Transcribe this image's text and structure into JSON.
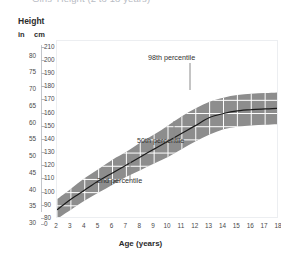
{
  "title_strip": {
    "text": "Girls' Height (2 to 18 years)"
  },
  "axis_heading": {
    "label": "Height"
  },
  "units": {
    "imperial": "in",
    "metric": "cm"
  },
  "y_axis_in": {
    "label": "in",
    "ticks": [
      80,
      75,
      70,
      65,
      60,
      55,
      50,
      45,
      40,
      35,
      30
    ]
  },
  "y_axis_cm": {
    "label": "cm",
    "ticks": [
      210,
      200,
      190,
      180,
      170,
      160,
      150,
      140,
      130,
      120,
      110,
      100,
      90,
      80,
      0
    ]
  },
  "x_axis": {
    "title": "Age (years)",
    "ticks": [
      2,
      3,
      4,
      5,
      6,
      7,
      8,
      9,
      10,
      11,
      12,
      13,
      14,
      15,
      16,
      17,
      18
    ]
  },
  "annotations": {
    "p98": "98th percentile",
    "p50": "50th percentile",
    "p2": "2nd percentile"
  },
  "colors": {
    "band": "#8d8d8d",
    "median_line": "#1a1a1a",
    "grid": "#ffffff",
    "frame": "#eceef1",
    "text": "#2b2b2b"
  },
  "chart_data": {
    "type": "area",
    "title": "Girls' Height (2 to 18 years)",
    "xlabel": "Age (years)",
    "ylabel": "Height",
    "xlim": [
      2,
      18
    ],
    "ylim": [
      80,
      215
    ],
    "y_unit_primary": "cm",
    "y_unit_secondary": "in",
    "grid": true,
    "legend": "inline-annotations",
    "x": [
      2,
      3,
      4,
      5,
      6,
      7,
      8,
      9,
      10,
      11,
      12,
      13,
      14,
      15,
      16,
      17,
      18
    ],
    "series": [
      {
        "name": "2nd percentile",
        "values": [
          80,
          87,
          94,
          100,
          106,
          112,
          117,
          122,
          127,
          133,
          139,
          144,
          148,
          150,
          151,
          151.5,
          152
        ]
      },
      {
        "name": "50th percentile",
        "values": [
          87,
          95,
          102,
          109,
          115,
          121,
          127,
          133,
          139,
          145,
          151,
          157,
          160,
          162,
          163,
          163.5,
          164
        ]
      },
      {
        "name": "98th percentile",
        "values": [
          95,
          103,
          111,
          118,
          125,
          131,
          138,
          144,
          151,
          158,
          164,
          169,
          172,
          174,
          175,
          175.5,
          176
        ]
      }
    ]
  }
}
